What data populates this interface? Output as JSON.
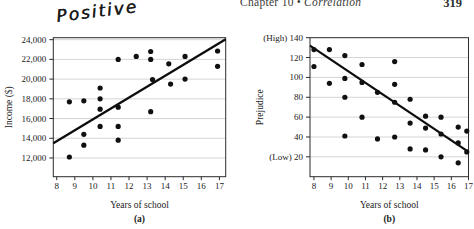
{
  "page": {
    "header": {
      "chapter": "Chapter 10",
      "separator": "•",
      "section": "Correlation",
      "page_number": "319"
    },
    "annotation": {
      "text": "Positive"
    }
  },
  "chart_data": [
    {
      "id": "a",
      "type": "scatter",
      "sublabel": "(a)",
      "xlabel": "Years of school",
      "ylabel": "Income ($)",
      "x_ticks": [
        8,
        9,
        10,
        11,
        12,
        13,
        14,
        15,
        16,
        17
      ],
      "y_ticks": [
        24000,
        22000,
        20000,
        18000,
        16000,
        14000,
        12000
      ],
      "y_tick_labels": [
        "24,000",
        "22,000",
        "20,000",
        "18,000",
        "16,000",
        "14,000",
        "12,000"
      ],
      "xlim": [
        7.81,
        17.35
      ],
      "ylim": [
        10100,
        24200
      ],
      "grid": "horizontal",
      "legend": "none",
      "correlation": "positive",
      "trend_line": {
        "x1": 7.81,
        "y1": 13500,
        "x2": 17.35,
        "y2": 24050
      },
      "points": [
        [
          8.7,
          17700
        ],
        [
          8.7,
          12100
        ],
        [
          9.5,
          17800
        ],
        [
          9.5,
          14400
        ],
        [
          9.5,
          13300
        ],
        [
          10.4,
          19100
        ],
        [
          10.4,
          18000
        ],
        [
          10.4,
          16950
        ],
        [
          10.4,
          15200
        ],
        [
          11.4,
          22000
        ],
        [
          11.4,
          17150
        ],
        [
          11.4,
          15200
        ],
        [
          11.4,
          13800
        ],
        [
          12.4,
          22300
        ],
        [
          13.2,
          22800
        ],
        [
          13.2,
          22000
        ],
        [
          13.3,
          19950
        ],
        [
          13.2,
          16700
        ],
        [
          14.2,
          21550
        ],
        [
          14.3,
          19500
        ],
        [
          15.1,
          22300
        ],
        [
          15.1,
          20000
        ],
        [
          16.9,
          22850
        ],
        [
          16.9,
          21300
        ]
      ],
      "point_color": "#101010",
      "line_color": "#0d0d0d"
    },
    {
      "id": "b",
      "type": "scatter",
      "sublabel": "(b)",
      "xlabel": "Years of school",
      "ylabel": "Prejudice",
      "x_ticks": [
        8,
        9,
        10,
        11,
        12,
        13,
        14,
        15,
        16,
        17
      ],
      "y_ticks": [
        140,
        120,
        100,
        80,
        60,
        40,
        20
      ],
      "y_tick_labels": [
        "(High) 140",
        "120",
        "100",
        "80",
        "60",
        "40",
        "(Low) 20"
      ],
      "xlim": [
        7.77,
        17.0
      ],
      "ylim": [
        0,
        140
      ],
      "grid": "horizontal",
      "legend": "none",
      "correlation": "negative",
      "trend_line": {
        "x1": 7.77,
        "y1": 132,
        "x2": 17.0,
        "y2": 25
      },
      "points": [
        [
          8.0,
          128
        ],
        [
          8.0,
          111
        ],
        [
          8.9,
          128
        ],
        [
          8.9,
          94
        ],
        [
          9.8,
          122
        ],
        [
          9.8,
          99
        ],
        [
          9.8,
          80
        ],
        [
          9.8,
          41
        ],
        [
          10.8,
          113
        ],
        [
          10.8,
          95
        ],
        [
          10.8,
          60
        ],
        [
          11.7,
          85
        ],
        [
          11.7,
          38
        ],
        [
          12.7,
          116
        ],
        [
          12.7,
          93
        ],
        [
          12.7,
          75
        ],
        [
          12.7,
          40
        ],
        [
          13.6,
          78
        ],
        [
          13.6,
          54
        ],
        [
          13.6,
          28
        ],
        [
          14.5,
          61
        ],
        [
          14.5,
          49
        ],
        [
          14.5,
          27
        ],
        [
          15.4,
          60
        ],
        [
          15.4,
          43
        ],
        [
          15.4,
          20
        ],
        [
          16.4,
          50
        ],
        [
          16.4,
          34
        ],
        [
          16.4,
          14
        ],
        [
          16.9,
          46
        ],
        [
          16.9,
          25
        ]
      ],
      "point_color": "#101010",
      "line_color": "#0d0d0d"
    }
  ]
}
